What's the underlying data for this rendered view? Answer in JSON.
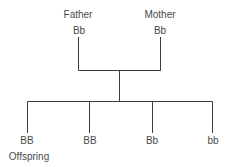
{
  "parents": [
    {
      "role": "Father",
      "genotype": "Bb"
    },
    {
      "role": "Mother",
      "genotype": "Bb"
    }
  ],
  "offspring": {
    "label": "Offspring",
    "genotypes": [
      "BB",
      "BB",
      "Bb",
      "bb"
    ]
  },
  "colors": {
    "line": "#3a3a3a",
    "text": "#4a4a4a"
  }
}
